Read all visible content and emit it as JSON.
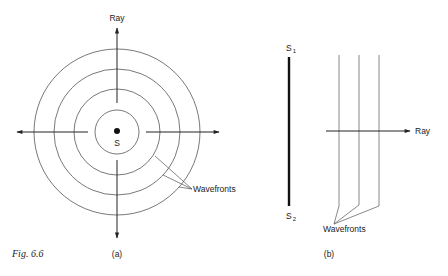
{
  "figure": {
    "caption": "Fig. 6.6",
    "panel_a": {
      "label": "(a)",
      "ray_label": "Ray",
      "source_label": "S",
      "wavefronts_label": "Wavefronts",
      "description": "Point source S emitting spherical wavefronts (concentric circles) with rays radiating outward",
      "circle_count": 4
    },
    "panel_b": {
      "label": "(b)",
      "ray_label": "Ray",
      "source_top_label": "S",
      "source_top_sub": "1",
      "source_bottom_label": "S",
      "source_bottom_sub": "2",
      "wavefronts_label": "Wavefronts",
      "description": "Extended line source S1-S2 producing plane wavefronts (parallel lines) with a ray perpendicular to them",
      "line_count": 3
    }
  },
  "colors": {
    "ink": "#222222",
    "thin_line": "#6a6a6a",
    "background": "#ffffff"
  }
}
